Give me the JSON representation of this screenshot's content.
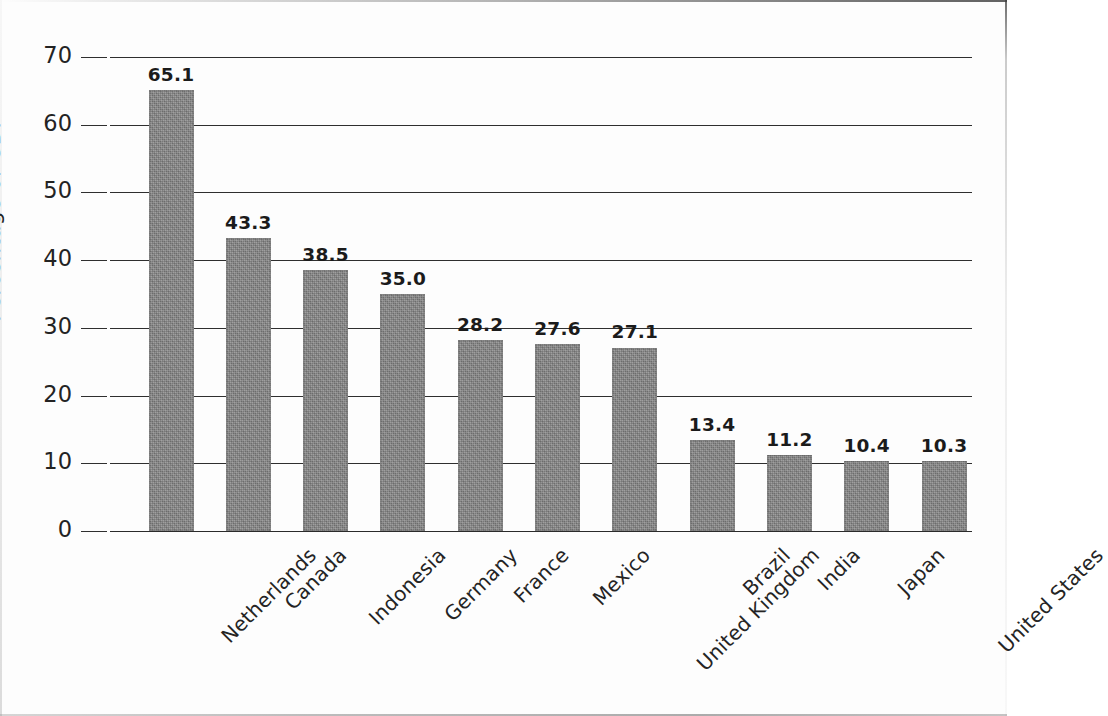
{
  "chart_data": {
    "type": "bar",
    "title": "",
    "subtitle": "",
    "xlabel": "",
    "ylabel": "Percentage of GDP",
    "ylim": [
      0,
      70
    ],
    "ytick_step": 10,
    "yticks": [
      "0",
      "10",
      "20",
      "30",
      "40",
      "50",
      "60",
      "70"
    ],
    "grid": true,
    "legend": null,
    "bar_color": "#838383",
    "axis_color": "#2f2f2f",
    "label_color": "#1b1b1b",
    "categories": [
      "Netherlands",
      "Canada",
      "Indonesia",
      "Germany",
      "France",
      "Mexico",
      "United Kingdom",
      "Brazil",
      "India",
      "Japan",
      "United States"
    ],
    "values": [
      65.1,
      43.3,
      38.5,
      35.0,
      28.2,
      27.6,
      27.1,
      13.4,
      11.2,
      10.4,
      10.3
    ],
    "value_labels": [
      "65.1",
      "43.3",
      "38.5",
      "35.0",
      "28.2",
      "27.6",
      "27.1",
      "13.4",
      "11.2",
      "10.4",
      "10.3"
    ]
  }
}
